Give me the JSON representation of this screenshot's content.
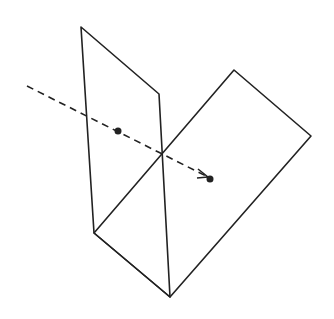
{
  "diagram": {
    "stroke_color": "#222222",
    "background": "#ffffff",
    "vertical_plane": {
      "points": [
        [
          81,
          27
        ],
        [
          159,
          94
        ],
        [
          170,
          297
        ],
        [
          94,
          233
        ]
      ]
    },
    "tilted_plane": {
      "points": [
        [
          94,
          233
        ],
        [
          234,
          70
        ],
        [
          311,
          136
        ],
        [
          170,
          297
        ]
      ]
    },
    "dashed_line": {
      "start": [
        27,
        86
      ],
      "end": [
        206,
        176
      ]
    },
    "arrowhead": {
      "tip": [
        208,
        177
      ],
      "wing1": [
        198,
        169
      ],
      "wing2": [
        197,
        178
      ]
    },
    "points": [
      {
        "name": "source-point",
        "x": 118,
        "y": 131,
        "r": 3.5
      },
      {
        "name": "target-point",
        "x": 210,
        "y": 179,
        "r": 3.5
      }
    ]
  }
}
